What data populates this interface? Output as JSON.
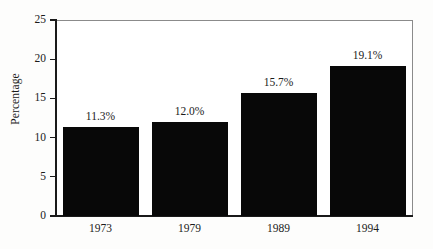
{
  "chart_data": {
    "type": "bar",
    "title": "",
    "subtitle": "",
    "xlabel": "",
    "ylabel": "Percentage",
    "categories": [
      "1973",
      "1979",
      "1989",
      "1994"
    ],
    "values": [
      11.3,
      12.0,
      15.7,
      19.1
    ],
    "data_labels": [
      "11.3%",
      "12.0%",
      "15.7%",
      "19.1%"
    ],
    "series": [
      {
        "name": "Percentage",
        "values": [
          11.3,
          12.0,
          15.7,
          19.1
        ]
      }
    ],
    "ylim": [
      0,
      25
    ],
    "y_ticks": [
      0,
      5,
      10,
      15,
      20,
      25
    ],
    "y_tick_labels": [
      "0",
      "5",
      "10",
      "15",
      "20",
      "25"
    ],
    "grid": false,
    "legend": false,
    "legend_position": "none",
    "bar_color": "#080808",
    "background_color": "#fdfdfc",
    "axis_color": "#1a1a1a",
    "frame_color": "#8b8b8b",
    "text_color": "#1b1b1b"
  }
}
